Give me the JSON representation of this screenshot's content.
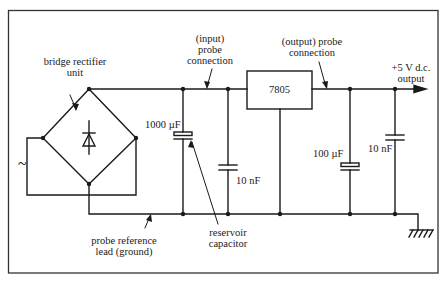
{
  "diagram": {
    "type": "circuit-schematic",
    "colors": {
      "line": "#1a1a1a",
      "background": "#ffffff",
      "border": "#333333"
    },
    "labels": {
      "bridge_rectifier": [
        "bridge rectifier",
        "unit"
      ],
      "input_probe": [
        "(input)",
        "probe",
        "connection"
      ],
      "output_probe": [
        "(output) probe",
        "connection"
      ],
      "output": [
        "+5 V d.c.",
        "output"
      ],
      "regulator": "7805",
      "reservoir_cap_value": "1000 µF",
      "input_decoupling_value": "10 nF",
      "output_cap_value": "100 µF",
      "output_decoupling_value": "10 nF",
      "reservoir": [
        "reservoir",
        "capacitor"
      ],
      "ground_lead": [
        "probe reference",
        "lead (ground)"
      ],
      "ac_symbol": "~"
    },
    "components": [
      {
        "id": "bridge",
        "name": "bridge rectifier unit"
      },
      {
        "id": "C1",
        "name": "reservoir capacitor",
        "value": "1000 µF",
        "kind": "electrolytic"
      },
      {
        "id": "C2",
        "name": "input decoupling",
        "value": "10 nF",
        "kind": "ceramic"
      },
      {
        "id": "U1",
        "name": "voltage regulator",
        "value": "7805"
      },
      {
        "id": "C3",
        "name": "output capacitor",
        "value": "100 µF",
        "kind": "electrolytic"
      },
      {
        "id": "C4",
        "name": "output decoupling",
        "value": "10 nF",
        "kind": "ceramic"
      }
    ]
  }
}
